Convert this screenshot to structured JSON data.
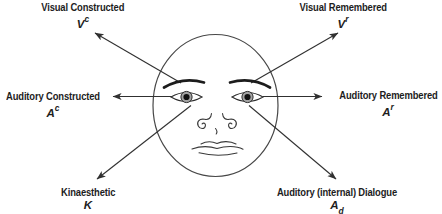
{
  "figure": {
    "background_color": "#ffffff",
    "ink_color": "#303030",
    "iris_color": "#a3a3a3",
    "pupil_color": "#121212",
    "labels": {
      "visual_constructed": {
        "title": "Visual Constructed",
        "abbr": "V",
        "script": "c",
        "script_position": "superscript"
      },
      "visual_remembered": {
        "title": "Visual Remembered",
        "abbr": "V",
        "script": "r",
        "script_position": "superscript"
      },
      "auditory_constructed": {
        "title": "Auditory Constructed",
        "abbr": "A",
        "script": "c",
        "script_position": "superscript"
      },
      "auditory_remembered": {
        "title": "Auditory Remembered",
        "abbr": "A",
        "script": "r",
        "script_position": "superscript"
      },
      "kinaesthetic": {
        "title": "Kinaesthetic",
        "abbr": "K",
        "script": "",
        "script_position": "none"
      },
      "auditory_dialogue": {
        "title": "Auditory (internal) Dialogue",
        "abbr": "A",
        "script": "d",
        "script_position": "subscript"
      }
    }
  }
}
